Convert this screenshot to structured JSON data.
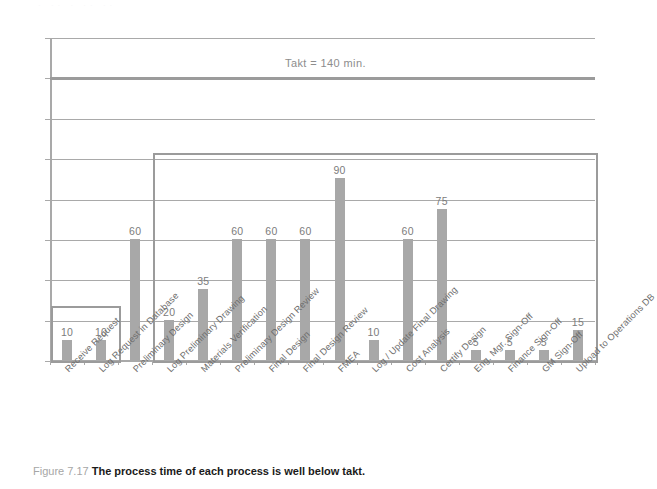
{
  "figure": {
    "caption_number": "Figure 7.17",
    "caption_text": "The process time of each process is well below takt.",
    "bleed_artifact": "· ·· ·  ·· ··"
  },
  "colors": {
    "bar": "#a8a8a8",
    "grid": "#a9a9a9",
    "takt_line": "#9b9b9b",
    "highlight_box": "#9b9b9b",
    "axis_text": "#8d8d8d",
    "value_text": "#7c7c7c",
    "xlabel_text": "#6e6e6e",
    "caption_number": "#a6a6a6",
    "caption_text": "#1a1a1a",
    "background": "#ffffff"
  },
  "annotations": {
    "takt_label": "Takt = 140 min.",
    "takt_value": 140
  },
  "chart_data": {
    "type": "bar",
    "title": "",
    "subtitle": "",
    "xlabel": "",
    "ylabel": "",
    "ylim": [
      0,
      160
    ],
    "yticks": [
      0,
      20,
      40,
      60,
      80,
      100,
      120,
      140,
      160
    ],
    "ytick_labels": [
      "0",
      "20",
      "40",
      "60",
      "80",
      "100",
      "120",
      "140",
      "160"
    ],
    "grid": true,
    "legend": "none",
    "orientation": "vertical",
    "categories": [
      "Receive Request",
      "Log Request in Database",
      "Preliminary Design",
      "Log Preliminary Drawing",
      "Materials Verification",
      "Preliminary Design Review",
      "Final Design",
      "Final Design Review",
      "FMEA",
      "Log / Update Final Drawing",
      "Cost Analysis",
      "Certify Design",
      "Eng. Mgr. Sign-Off",
      "Finance Sign-Off",
      "GM Sign-Off",
      "Upload to Operations DB"
    ],
    "values": [
      10,
      10,
      60,
      20,
      35,
      60,
      60,
      60,
      90,
      10,
      60,
      75,
      5,
      5,
      5,
      15
    ],
    "value_labels": [
      "10",
      "10",
      "60",
      "20",
      "35",
      "60",
      "60",
      "60",
      "90",
      "10",
      "60",
      "75",
      "5",
      "5",
      "5",
      "15"
    ],
    "reference_lines": [
      {
        "name": "takt",
        "value": 140,
        "label": "Takt = 140 min."
      }
    ],
    "highlight_boxes": [
      {
        "name": "first-group-box",
        "from_category_index": 0,
        "to_category_index": 1,
        "top_value": 27
      },
      {
        "name": "main-group-box",
        "from_category_index": 3,
        "to_category_index": 15,
        "top_value": 103
      }
    ]
  }
}
